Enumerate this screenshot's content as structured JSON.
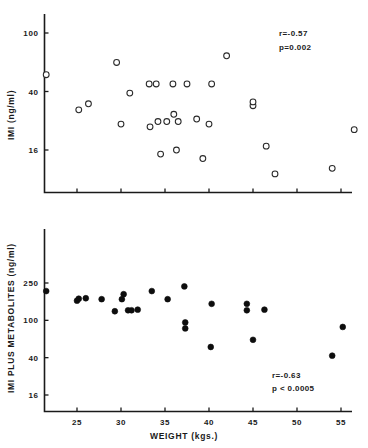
{
  "figure": {
    "title": "",
    "panels": [
      "top",
      "bottom"
    ]
  },
  "chart_data": [
    {
      "id": "top",
      "type": "scatter",
      "title": "",
      "xlabel": "",
      "ylabel": "IMI (ng/ml)",
      "yscale": "log",
      "xscale": "linear",
      "xlim": [
        21,
        57.5
      ],
      "ylim": [
        7,
        130
      ],
      "xticks": [
        25,
        30,
        35,
        40,
        45,
        50,
        55
      ],
      "xticklabels": [
        "",
        "",
        "",
        "",
        "",
        "",
        ""
      ],
      "yticks": [
        100,
        40,
        16
      ],
      "yticklabels": [
        "100",
        "40",
        "16"
      ],
      "grid": false,
      "legend": null,
      "marker": "open-circle",
      "annotations": [
        {
          "name": "correlation",
          "text": "r=-0.57"
        },
        {
          "name": "p-value",
          "text": "p=0.002"
        }
      ],
      "stats": {
        "r": -0.57,
        "p": 0.002
      },
      "points": [
        {
          "x": 21.5,
          "y": 52
        },
        {
          "x": 29.5,
          "y": 63
        },
        {
          "x": 25.2,
          "y": 30
        },
        {
          "x": 26.3,
          "y": 33
        },
        {
          "x": 31.0,
          "y": 39
        },
        {
          "x": 33.2,
          "y": 45
        },
        {
          "x": 34.0,
          "y": 45
        },
        {
          "x": 35.9,
          "y": 45
        },
        {
          "x": 37.5,
          "y": 45
        },
        {
          "x": 40.3,
          "y": 45
        },
        {
          "x": 33.3,
          "y": 23
        },
        {
          "x": 34.2,
          "y": 25
        },
        {
          "x": 35.2,
          "y": 25
        },
        {
          "x": 36.5,
          "y": 25
        },
        {
          "x": 36.0,
          "y": 28
        },
        {
          "x": 34.5,
          "y": 15
        },
        {
          "x": 36.3,
          "y": 16
        },
        {
          "x": 38.6,
          "y": 26
        },
        {
          "x": 42.0,
          "y": 70
        },
        {
          "x": 40.0,
          "y": 24
        },
        {
          "x": 39.3,
          "y": 14
        },
        {
          "x": 45.0,
          "y": 32
        },
        {
          "x": 45.0,
          "y": 34
        },
        {
          "x": 46.5,
          "y": 17
        },
        {
          "x": 47.5,
          "y": 11
        },
        {
          "x": 54.0,
          "y": 12
        },
        {
          "x": 56.5,
          "y": 22
        },
        {
          "x": 30.0,
          "y": 24
        }
      ]
    },
    {
      "id": "bottom",
      "type": "scatter",
      "title": "",
      "xlabel": "WEIGHT (kgs.)",
      "ylabel": "IMI  PLUS  METABOLITES (ng/ml)",
      "yscale": "log",
      "xscale": "linear",
      "xlim": [
        21,
        57.5
      ],
      "ylim": [
        10,
        420
      ],
      "xticks": [
        25,
        30,
        35,
        40,
        45,
        50,
        55
      ],
      "xticklabels": [
        "25",
        "30",
        "35",
        "40",
        "45",
        "50",
        "55"
      ],
      "yticks": [
        250,
        100,
        40,
        16
      ],
      "yticklabels": [
        "250",
        "100",
        "40",
        "16"
      ],
      "grid": false,
      "legend": null,
      "marker": "filled-circle",
      "annotations": [
        {
          "name": "correlation",
          "text": "r=-0.63"
        },
        {
          "name": "p-value",
          "text": "p < 0.0005"
        }
      ],
      "stats": {
        "r": -0.63,
        "p": 0.0005
      },
      "points": [
        {
          "x": 21.5,
          "y": 205
        },
        {
          "x": 25.0,
          "y": 162
        },
        {
          "x": 25.2,
          "y": 170
        },
        {
          "x": 26.0,
          "y": 172
        },
        {
          "x": 27.8,
          "y": 168
        },
        {
          "x": 29.3,
          "y": 125
        },
        {
          "x": 30.1,
          "y": 168
        },
        {
          "x": 30.3,
          "y": 190
        },
        {
          "x": 30.8,
          "y": 128
        },
        {
          "x": 31.2,
          "y": 128
        },
        {
          "x": 31.9,
          "y": 130
        },
        {
          "x": 33.5,
          "y": 205
        },
        {
          "x": 35.3,
          "y": 168
        },
        {
          "x": 37.2,
          "y": 230
        },
        {
          "x": 37.3,
          "y": 95
        },
        {
          "x": 37.3,
          "y": 82
        },
        {
          "x": 40.3,
          "y": 150
        },
        {
          "x": 40.2,
          "y": 52
        },
        {
          "x": 44.3,
          "y": 150
        },
        {
          "x": 44.3,
          "y": 128
        },
        {
          "x": 45.0,
          "y": 62
        },
        {
          "x": 46.3,
          "y": 130
        },
        {
          "x": 54.0,
          "y": 42
        },
        {
          "x": 55.2,
          "y": 85
        }
      ]
    }
  ]
}
